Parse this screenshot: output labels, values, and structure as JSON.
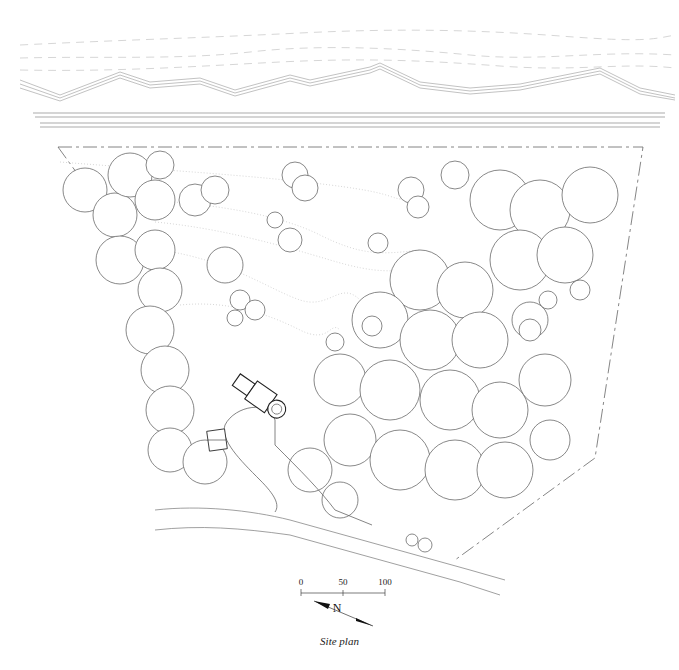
{
  "drawing": {
    "title": "Site plan",
    "type": "architectural site plan",
    "scale_bar": {
      "ticks": [
        "0",
        "50",
        "100"
      ],
      "unit": "feet (unlabeled)"
    },
    "north_arrow": {
      "label": "N"
    },
    "features": [
      "shoreline with waves (top)",
      "road / right-of-way (double lines)",
      "property boundary (dashed trapezoid)",
      "tree canopy clusters",
      "house with circular terrace",
      "driveway with turnaround",
      "garage / outbuilding",
      "topographic contour lines (dotted)",
      "access road (bottom)"
    ]
  }
}
